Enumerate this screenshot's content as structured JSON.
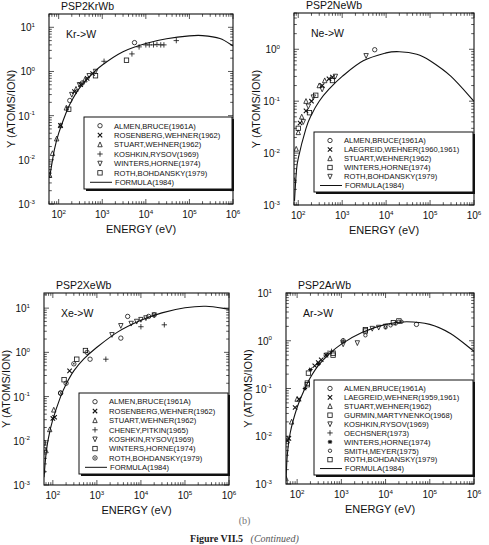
{
  "caption": {
    "sub_label": "(b)",
    "figure_label": "Figure VII.5",
    "figure_note": "(Continued)"
  },
  "chart_data": [
    {
      "type": "scatter",
      "panel_id": "PSP2KrWb",
      "title": "PSP2KrWb",
      "annotation": "Kr->W",
      "xlabel": "ENERGY (eV)",
      "ylabel": "Y (ATOMS/ION)",
      "xscale": "log",
      "yscale": "log",
      "xlim": [
        60,
        1000000
      ],
      "ylim": [
        0.001,
        20
      ],
      "xticks": [
        "10^2",
        "10^3",
        "10^4",
        "10^5",
        "10^6"
      ],
      "yticks": [
        "10^-3",
        "10^-2",
        "10^-1",
        "10^0",
        "10^1"
      ],
      "legend_position": "lower right",
      "series": [
        {
          "name": "ALMEN,BRUCE(1961A)",
          "marker": "circle",
          "x": [
            180,
            350,
            5500
          ],
          "y": [
            0.22,
            0.55,
            4.5
          ]
        },
        {
          "name": "ROSENBERG,WEHNER(1962)",
          "marker": "x",
          "x": [
            110,
            230,
            320,
            450,
            600
          ],
          "y": [
            0.06,
            0.35,
            0.5,
            0.7,
            0.9
          ]
        },
        {
          "name": "STUART,WEHNER(1962)",
          "marker": "triangle-up",
          "x": [
            62,
            72,
            90,
            110,
            150,
            250,
            400
          ],
          "y": [
            0.0045,
            0.014,
            0.03,
            0.06,
            0.15,
            0.4,
            0.65
          ]
        },
        {
          "name": "KOSHKIN,RYSOV(1969)",
          "marker": "plus",
          "x": [
            1100,
            4800,
            7000,
            10000,
            12000,
            15000,
            18000,
            22000,
            26000,
            50000
          ],
          "y": [
            1.7,
            2.5,
            3.6,
            4.0,
            4.0,
            4.0,
            4.1,
            4.0,
            4.0,
            5.0
          ]
        },
        {
          "name": "WINTERS,HORNE(1974)",
          "marker": "triangle-down",
          "x": [
            200,
            300,
            500,
            700
          ],
          "y": [
            0.3,
            0.5,
            0.8,
            1.0
          ]
        },
        {
          "name": "ROTH,BOHDANSKY(1979)",
          "marker": "square",
          "x": [
            170,
            700,
            3600
          ],
          "y": [
            0.14,
            0.8,
            1.8
          ]
        },
        {
          "name": "FORMULA(1984)",
          "marker": "line",
          "x": [
            62,
            80,
            100,
            150,
            200,
            300,
            500,
            1000,
            3000,
            10000,
            30000,
            100000,
            200000,
            500000,
            1000000
          ],
          "y": [
            0.004,
            0.017,
            0.04,
            0.12,
            0.22,
            0.42,
            0.75,
            1.4,
            2.8,
            4.3,
            5.5,
            6.4,
            6.5,
            5.6,
            3.8
          ]
        }
      ]
    },
    {
      "type": "scatter",
      "panel_id": "PSP2NeWb",
      "title": "PSP2NeWb",
      "annotation": "Ne->W",
      "xlabel": "ENERGY (eV)",
      "ylabel": "Y (ATOMS/ION)",
      "xscale": "log",
      "yscale": "log",
      "xlim": [
        80,
        1000000
      ],
      "ylim": [
        0.001,
        5
      ],
      "xticks": [
        "10^2",
        "10^3",
        "10^4",
        "10^5",
        "10^6"
      ],
      "yticks": [
        "10^-3",
        "10^-2",
        "10^-1",
        "10^0"
      ],
      "legend_position": "lower right",
      "series": [
        {
          "name": "ALMEN,BRUCE(1961A)",
          "marker": "circle",
          "x": [
            5500
          ],
          "y": [
            0.98
          ]
        },
        {
          "name": "LAEGREID,WEHNER(1960,1961)",
          "marker": "x",
          "x": [
            110,
            150,
            200,
            350,
            500,
            600
          ],
          "y": [
            0.038,
            0.065,
            0.1,
            0.2,
            0.27,
            0.29
          ]
        },
        {
          "name": "STUART,WEHNER(1962)",
          "marker": "triangle-up",
          "x": [
            80,
            90,
            100,
            120,
            150,
            300,
            400
          ],
          "y": [
            0.003,
            0.012,
            0.025,
            0.05,
            0.1,
            0.2,
            0.25
          ]
        },
        {
          "name": "WINTERS,HORNE(1974)",
          "marker": "square",
          "x": [
            100,
            180,
            250,
            600
          ],
          "y": [
            0.03,
            0.06,
            0.13,
            0.25
          ]
        },
        {
          "name": "ROTH,BOHDANSKY(1979)",
          "marker": "triangle-down",
          "x": [
            130,
            170,
            220,
            350,
            700,
            3500
          ],
          "y": [
            0.04,
            0.08,
            0.12,
            0.17,
            0.3,
            0.75
          ]
        },
        {
          "name": "FORMULA(1984)",
          "marker": "line",
          "x": [
            82,
            90,
            100,
            150,
            200,
            300,
            500,
            1000,
            3000,
            10000,
            20000,
            50000,
            100000,
            300000,
            1000000
          ],
          "y": [
            0.0012,
            0.004,
            0.008,
            0.03,
            0.055,
            0.1,
            0.17,
            0.3,
            0.6,
            0.85,
            0.9,
            0.8,
            0.6,
            0.3,
            0.1
          ]
        }
      ]
    },
    {
      "type": "scatter",
      "panel_id": "PSP2XeWb",
      "title": "PSP2XeWb",
      "annotation": "Xe->W",
      "xlabel": "ENERGY (eV)",
      "ylabel": "Y (ATOMS/ION)",
      "xscale": "log",
      "yscale": "log",
      "xlim": [
        63,
        1000000
      ],
      "ylim": [
        0.001,
        22
      ],
      "xticks": [
        "10^2",
        "10^3",
        "10^4",
        "10^5",
        "10^6"
      ],
      "yticks": [
        "10^-3",
        "10^-2",
        "10^-1",
        "10^0",
        "10^1"
      ],
      "legend_position": "lower right",
      "series": [
        {
          "name": "ALMEN,BRUCE(1961A)",
          "marker": "circle",
          "x": [
            150,
            700,
            3500,
            5000,
            15000
          ],
          "y": [
            0.12,
            0.7,
            2.1,
            6.5,
            6.5
          ]
        },
        {
          "name": "ROSENBERG,WEHNER(1962)",
          "marker": "x",
          "x": [
            100,
            110,
            240
          ],
          "y": [
            0.032,
            0.034,
            0.38
          ]
        },
        {
          "name": "STUART,WEHNER(1962)",
          "marker": "triangle-up",
          "x": [
            70,
            85,
            105
          ],
          "y": [
            0.006,
            0.018,
            0.05
          ]
        },
        {
          "name": "CHENEY,PITKIN(1965)",
          "marker": "plus",
          "x": [
            1600,
            10000,
            34000
          ],
          "y": [
            0.7,
            3.8,
            4.2
          ]
        },
        {
          "name": "KOSHKIN,RYSOV(1969)",
          "marker": "triangle-down",
          "x": [
            2200,
            3500,
            6000,
            8000,
            10000,
            13000,
            20000
          ],
          "y": [
            2.5,
            4.0,
            4.5,
            5.0,
            5.5,
            6.0,
            7.0
          ]
        },
        {
          "name": "WINTERS,HORNE(1974)",
          "marker": "square",
          "x": [
            60,
            180,
            350,
            550
          ],
          "y": [
            0.009,
            0.24,
            0.7,
            1.1
          ]
        },
        {
          "name": "ROTH,BOHDANSKY(1979)",
          "marker": "circle-dot",
          "x": [
            60,
            150,
            200,
            300,
            600,
            20000
          ],
          "y": [
            0.002,
            0.12,
            0.2,
            0.55,
            1.0,
            7.0
          ]
        },
        {
          "name": "FORMULA(1984)",
          "marker": "line",
          "x": [
            63,
            70,
            80,
            100,
            150,
            200,
            300,
            500,
            1000,
            3000,
            10000,
            30000,
            100000,
            300000,
            1000000
          ],
          "y": [
            0.0015,
            0.005,
            0.012,
            0.03,
            0.1,
            0.19,
            0.38,
            0.7,
            1.3,
            2.9,
            5.3,
            7.8,
            10.2,
            11.0,
            9.5
          ]
        }
      ]
    },
    {
      "type": "scatter",
      "panel_id": "PSP2ArWb",
      "title": "PSP2ArWb",
      "annotation": "Ar->W",
      "xlabel": "ENERGY (eV)",
      "ylabel": "Y (ATOMS/ION)",
      "xscale": "log",
      "yscale": "log",
      "xlim": [
        56,
        1000000
      ],
      "ylim": [
        0.001,
        10
      ],
      "xticks": [
        "10^2",
        "10^3",
        "10^4",
        "10^5",
        "10^6"
      ],
      "yticks": [
        "10^-3",
        "10^-2",
        "10^-1",
        "10^0",
        "10^1"
      ],
      "legend_position": "lower right",
      "series": [
        {
          "name": "ALMEN,BRUCE(1961A)",
          "marker": "circle",
          "x": [
            1100,
            50000
          ],
          "y": [
            1.0,
            2.2
          ]
        },
        {
          "name": "LAEGREID,WEHNER(1959,1961)",
          "marker": "x",
          "x": [
            60,
            65,
            90,
            110,
            250,
            300,
            350,
            450
          ],
          "y": [
            0.008,
            0.009,
            0.04,
            0.06,
            0.3,
            0.35,
            0.4,
            0.5
          ]
        },
        {
          "name": "STUART,WEHNER(1962)",
          "marker": "triangle-up",
          "x": [
            56,
            75,
            100
          ],
          "y": [
            0.0013,
            0.02,
            0.06
          ]
        },
        {
          "name": "GURMIN,MARTYNENKO(1968)",
          "marker": "square",
          "x": [
            170,
            180,
            650,
            3500,
            20000
          ],
          "y": [
            0.12,
            0.21,
            0.55,
            1.6,
            2.6
          ]
        },
        {
          "name": "KOSHKIN,RYSOV(1969)",
          "marker": "triangle-down",
          "x": [
            1100,
            2300,
            5000,
            7000,
            10000
          ],
          "y": [
            0.85,
            0.9,
            1.8,
            1.9,
            2.0
          ]
        },
        {
          "name": "OECHSNER(1973)",
          "marker": "plus",
          "x": [
            450,
            500,
            600,
            1100
          ],
          "y": [
            0.5,
            0.55,
            0.6,
            1.0
          ]
        },
        {
          "name": "WINTERS,HORNE(1974)",
          "marker": "asterisk",
          "x": [
            150,
            200,
            300
          ],
          "y": [
            0.1,
            0.25,
            0.33
          ]
        },
        {
          "name": "SMITH,MEYER(1975)",
          "marker": "circle-small",
          "x": [
            3500,
            10000,
            13000,
            17000,
            20000,
            23000
          ],
          "y": [
            1.3,
            1.9,
            2.1,
            2.3,
            2.5,
            2.5
          ]
        },
        {
          "name": "ROTH,BOHDANSKY(1979)",
          "marker": "square",
          "x": [
            170,
            650,
            3500,
            15000
          ],
          "y": [
            0.13,
            0.5,
            1.7,
            2.4
          ]
        },
        {
          "name": "FORMULA(1984)",
          "marker": "line",
          "x": [
            56,
            60,
            70,
            100,
            150,
            200,
            300,
            500,
            1000,
            3000,
            10000,
            30000,
            100000,
            300000,
            1000000
          ],
          "y": [
            0.0012,
            0.004,
            0.012,
            0.04,
            0.1,
            0.17,
            0.3,
            0.5,
            0.85,
            1.5,
            2.2,
            2.5,
            2.2,
            1.4,
            0.6
          ]
        }
      ]
    }
  ]
}
